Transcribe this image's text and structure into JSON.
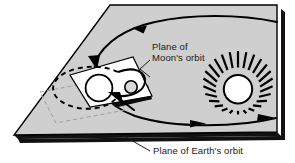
{
  "figure": {
    "type": "astronomy-diagram",
    "labels": {
      "moon_plane_line1": "Plane of",
      "moon_plane_line2": "Moon's orbit",
      "earth_plane": "Plane of Earth's orbit"
    },
    "objects": {
      "sun": "sun-icon",
      "earth": "earth-circle",
      "moon": "moon-circle"
    },
    "colors": {
      "plane_fill": "#cfcfcf",
      "plane_stroke": "#000000",
      "shadow": "#111111",
      "moon_plane_fill": "#ffffff",
      "orbit_stroke": "#000000",
      "label_text": "#1a1a1a",
      "dashed_guide": "#9a9a9a",
      "background": "#ffffff"
    },
    "annotations": {
      "orbit_direction_top": "arrow-left",
      "orbit_direction_bottom": "arrow-right",
      "moon_orbit_style": "dashed-ellipse"
    }
  }
}
